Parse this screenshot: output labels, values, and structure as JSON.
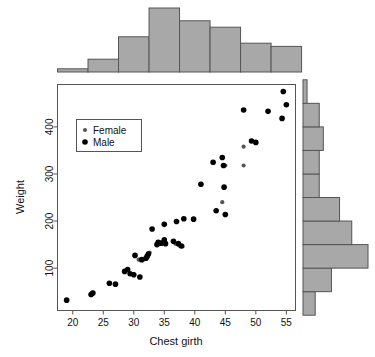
{
  "figure": {
    "type": "scatter-with-marginal-histograms",
    "background": "#ffffff"
  },
  "chart_data": {
    "type": "scatter",
    "title": "",
    "xlabel": "Chest girth",
    "ylabel": "Weight",
    "xlim": [
      17.5,
      56.5
    ],
    "ylim": [
      10,
      490
    ],
    "xticks": [
      20,
      25,
      30,
      35,
      40,
      45,
      50,
      55
    ],
    "yticks": [
      100,
      200,
      300,
      400
    ],
    "grid": false,
    "legend": {
      "position": "top-left-inside",
      "entries": [
        {
          "name": "Female",
          "color": "#555555",
          "marker": "circle",
          "size": 3
        },
        {
          "name": "Male",
          "color": "#000000",
          "marker": "circle",
          "size": 4
        }
      ]
    },
    "series": [
      {
        "name": "Female",
        "color": "#555555",
        "points": [
          [
            19.0,
            32
          ],
          [
            23.0,
            44
          ],
          [
            23.2,
            48
          ],
          [
            26.0,
            68
          ],
          [
            27.0,
            66
          ],
          [
            28.5,
            93
          ],
          [
            29.0,
            97
          ],
          [
            29.5,
            88
          ],
          [
            30.0,
            86
          ],
          [
            31.0,
            81
          ],
          [
            30.8,
            118
          ],
          [
            31.5,
            117
          ],
          [
            32.0,
            121
          ],
          [
            32.1,
            126
          ],
          [
            32.3,
            131
          ],
          [
            32.6,
            133
          ],
          [
            34.0,
            150
          ],
          [
            35.0,
            158
          ],
          [
            36.5,
            157
          ],
          [
            36.8,
            152
          ],
          [
            37.5,
            148
          ],
          [
            38.0,
            146
          ],
          [
            44.5,
            240
          ],
          [
            45.0,
            318
          ],
          [
            48.0,
            318
          ],
          [
            48.0,
            358
          ]
        ]
      },
      {
        "name": "Male",
        "color": "#000000",
        "points": [
          [
            19.0,
            32
          ],
          [
            23.0,
            44
          ],
          [
            23.3,
            47
          ],
          [
            26.0,
            68
          ],
          [
            27.0,
            66
          ],
          [
            28.5,
            93
          ],
          [
            29.0,
            97
          ],
          [
            29.4,
            88
          ],
          [
            30.0,
            86
          ],
          [
            30.2,
            127
          ],
          [
            31.0,
            81
          ],
          [
            31.3,
            118
          ],
          [
            32.0,
            121
          ],
          [
            32.2,
            125
          ],
          [
            32.4,
            130
          ],
          [
            33.0,
            183
          ],
          [
            33.8,
            150
          ],
          [
            34.0,
            155
          ],
          [
            34.5,
            153
          ],
          [
            35.0,
            160
          ],
          [
            35.0,
            193
          ],
          [
            35.2,
            152
          ],
          [
            36.5,
            157
          ],
          [
            37.0,
            199
          ],
          [
            37.3,
            152
          ],
          [
            37.8,
            147
          ],
          [
            38.2,
            205
          ],
          [
            39.8,
            204
          ],
          [
            41.0,
            278
          ],
          [
            43.0,
            325
          ],
          [
            43.5,
            222
          ],
          [
            44.5,
            335
          ],
          [
            44.7,
            318
          ],
          [
            44.8,
            272
          ],
          [
            45.0,
            214
          ],
          [
            48.0,
            436
          ],
          [
            49.3,
            370
          ],
          [
            50.0,
            367
          ],
          [
            52.0,
            433
          ],
          [
            54.3,
            418
          ],
          [
            54.5,
            475
          ],
          [
            55.0,
            447
          ]
        ]
      }
    ]
  },
  "top_histogram": {
    "orientation": "vertical",
    "variable": "Chest girth",
    "bin_edges": [
      17.5,
      22.5,
      27.5,
      32.5,
      37.5,
      42.5,
      47.5,
      52.5,
      57.5
    ],
    "counts": [
      1,
      4,
      11,
      20,
      16,
      14,
      9,
      8
    ],
    "bar_fill": "#a8a8a8",
    "bar_stroke": "#555555"
  },
  "right_histogram": {
    "orientation": "horizontal",
    "variable": "Weight",
    "bin_edges": [
      0,
      50,
      100,
      150,
      200,
      250,
      300,
      350,
      400,
      450,
      500
    ],
    "counts": [
      3,
      7,
      16,
      12,
      9,
      4,
      4,
      5,
      4,
      1
    ],
    "bar_fill": "#a8a8a8",
    "bar_stroke": "#555555"
  },
  "axes": {
    "frame_color": "#555555",
    "tick_color": "#555555"
  }
}
